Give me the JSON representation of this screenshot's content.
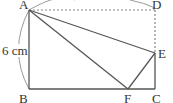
{
  "diagram": {
    "labels": {
      "A": "A",
      "B": "B",
      "C": "C",
      "D": "D",
      "E": "E",
      "F": "F",
      "side_ab": "6 cm"
    },
    "points": {
      "A": [
        29,
        10
      ],
      "B": [
        29,
        89
      ],
      "C": [
        155,
        89
      ],
      "D": [
        155,
        10
      ],
      "E": [
        155,
        53
      ],
      "F": [
        128,
        89
      ]
    },
    "colors": {
      "line": "#555555",
      "dotted": "#888888",
      "arc": "#9a9a9a"
    }
  }
}
